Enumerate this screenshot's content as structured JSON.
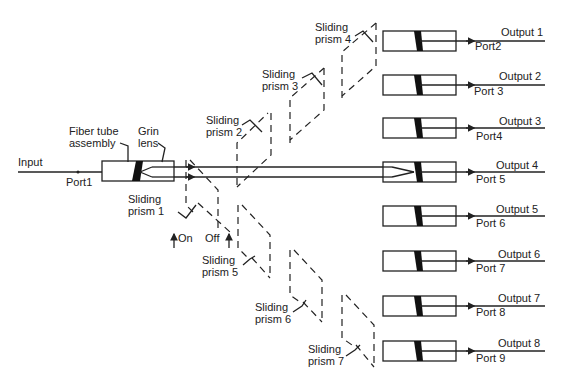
{
  "diagram": {
    "type": "optical switch schematic",
    "input": {
      "label": "Input",
      "port": "Port1"
    },
    "input_components": {
      "fiber_tube": "Fiber tube\nassembly",
      "fiber_tube_line1": "Fiber tube",
      "fiber_tube_line2": "assembly",
      "grin_lens_line1": "Grin",
      "grin_lens_line2": "lens"
    },
    "legend": {
      "on": "On",
      "off": "Off"
    },
    "prisms": [
      {
        "line1": "Sliding",
        "line2": "prism 1"
      },
      {
        "line1": "Sliding",
        "line2": "prism 2"
      },
      {
        "line1": "Sliding",
        "line2": "prism 3"
      },
      {
        "line1": "Sliding",
        "line2": "prism 4"
      },
      {
        "line1": "Sliding",
        "line2": "prism 5"
      },
      {
        "line1": "Sliding",
        "line2": "prism 6"
      },
      {
        "line1": "Sliding",
        "line2": "prism 7"
      }
    ],
    "outputs": [
      {
        "output": "Output 1",
        "port": "Port2"
      },
      {
        "output": "Output 2",
        "port": "Port 3"
      },
      {
        "output": "Output 3",
        "port": "Port4"
      },
      {
        "output": "Output 4",
        "port": "Port 5"
      },
      {
        "output": "Output 5",
        "port": "Port 6"
      },
      {
        "output": "Output 6",
        "port": "Port 7"
      },
      {
        "output": "Output 7",
        "port": "Port 8"
      },
      {
        "output": "Output 8",
        "port": "Port 9"
      }
    ]
  }
}
